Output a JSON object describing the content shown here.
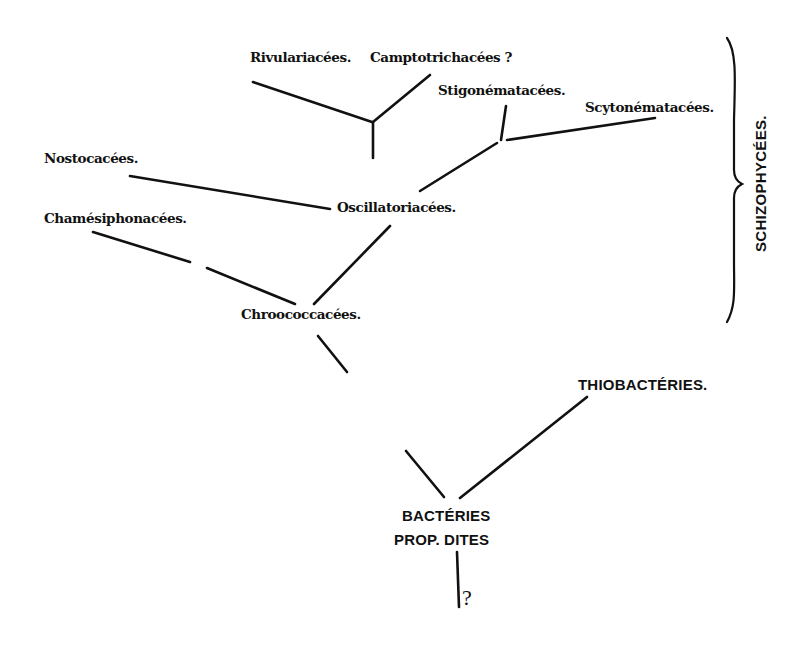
{
  "diagram": {
    "type": "phylogenetic-tree",
    "group_bracket": {
      "label": "SCHIZOPHYCÉES.",
      "members": [
        "Rivulariacées.",
        "Camptotrichacées ?",
        "Stigonématacées.",
        "Scytonématacées.",
        "Nostocacées.",
        "Oscillatoriacées.",
        "Chamésiphonacées.",
        "Chroococcacées."
      ]
    },
    "nodes": {
      "rivulariacees": "Rivulariacées.",
      "camptotrichacees": "Camptotrichacées ?",
      "stigonematacees": "Stigonématacées.",
      "scytonematacees": "Scytonématacées.",
      "nostocacees": "Nostocacées.",
      "oscillatoriacees": "Oscillatoriacées.",
      "chamesiphonacees": "Chamésiphonacées.",
      "chroococcacees": "Chroococcacées.",
      "thiobacteries": "THIOBACTÉRIES.",
      "bacteries_line1": "BACTÉRIES",
      "bacteries_line2": "PROP.  DITES",
      "root_unknown": "?"
    },
    "edges": [
      {
        "from": "Rivulariacées.",
        "to": "Oscillatoriacées."
      },
      {
        "from": "Camptotrichacées ?",
        "to": "Oscillatoriacées."
      },
      {
        "from": "Stigonématacées.",
        "to": "Oscillatoriacées."
      },
      {
        "from": "Scytonématacées.",
        "to": "Oscillatoriacées."
      },
      {
        "from": "Nostocacées.",
        "to": "Oscillatoriacées."
      },
      {
        "from": "Oscillatoriacées.",
        "to": "Chroococcacées."
      },
      {
        "from": "Chamésiphonacées.",
        "to": "Chroococcacées.",
        "style": "dashed"
      },
      {
        "from": "Chroococcacées.",
        "to": "BACTÉRIES PROP. DITES",
        "style": "broken"
      },
      {
        "from": "THIOBACTÉRIES.",
        "to": "BACTÉRIES PROP. DITES"
      },
      {
        "from": "BACTÉRIES PROP. DITES",
        "to": "?"
      }
    ]
  }
}
